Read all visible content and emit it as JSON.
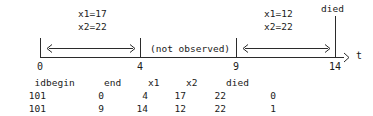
{
  "diagram": {
    "axis": {
      "variable_label": "t",
      "ticks": [
        {
          "label": "0",
          "x": 40
        },
        {
          "label": "4",
          "x": 140
        },
        {
          "label": "9",
          "x": 236
        },
        {
          "label": "14",
          "x": 335
        }
      ]
    },
    "intervals": [
      {
        "name": "first-observed-interval",
        "from": "0",
        "to": "4",
        "x1_label": "x1=17",
        "x2_label": "x2=22"
      },
      {
        "name": "second-observed-interval",
        "from": "9",
        "to": "14",
        "x1_label": "x1=12",
        "x2_label": "x2=22"
      }
    ],
    "gap_label": "(not observed)",
    "died_label": "died"
  },
  "table": {
    "headers": [
      "id",
      "begin",
      "end",
      "x1",
      "x2",
      "died"
    ],
    "rows": [
      [
        "101",
        "0",
        "4",
        "17",
        "22",
        "0"
      ],
      [
        "101",
        "9",
        "14",
        "12",
        "22",
        "1"
      ]
    ]
  }
}
